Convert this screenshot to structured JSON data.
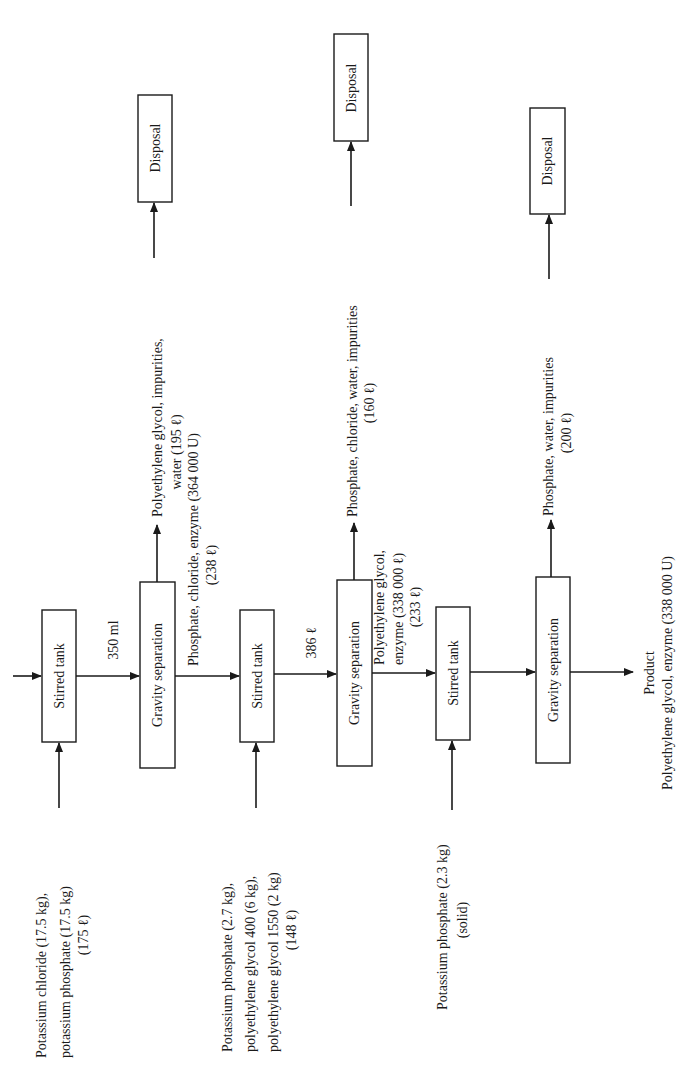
{
  "diagram": {
    "orientation": "rotated 90° counter-clockwise (text reads bottom-to-top)",
    "units": {
      "box": [
        {
          "id": "stirred-tank-1",
          "label": "Stirred tank"
        },
        {
          "id": "gravity-separation-1",
          "label": "Gravity separation"
        },
        {
          "id": "stirred-tank-2",
          "label": "Stirred tank"
        },
        {
          "id": "gravity-separation-2",
          "label": "Gravity separation"
        },
        {
          "id": "stirred-tank-3",
          "label": "Stirred tank"
        },
        {
          "id": "gravity-separation-3",
          "label": "Gravity separation"
        },
        {
          "id": "disposal-1",
          "label": "Disposal"
        },
        {
          "id": "disposal-2",
          "label": "Disposal"
        },
        {
          "id": "disposal-3",
          "label": "Disposal"
        }
      ]
    },
    "feeds": [
      {
        "lines": [
          "Potassium chloride (17.5 kg),",
          "potassium phosphate (17.5 kg)",
          "(175 ℓ)"
        ]
      },
      {
        "lines": [
          "Potassium phosphate (2.7 kg),",
          "polyethylene glycol 400 (6 kg),",
          "polyethylene glycol 1550 (2 kg)",
          "(148 ℓ)"
        ]
      },
      {
        "lines": [
          "Potassium phosphate (2.3 kg)",
          "(solid)"
        ]
      }
    ],
    "streams": [
      {
        "lines": [
          "350 ml"
        ]
      },
      {
        "lines": [
          "Phosphate, chloride, enzyme (364 000 U)",
          "(238 ℓ)"
        ]
      },
      {
        "lines": [
          "386 ℓ"
        ]
      },
      {
        "lines": [
          "Polyethylene glycol,",
          "enzyme (338 000 ℓ)",
          "(233 ℓ)"
        ]
      }
    ],
    "wastes": [
      {
        "lines": [
          "Polyethylene glycol, impurities,",
          "water (195 ℓ)"
        ]
      },
      {
        "lines": [
          "Phosphate, chloride, water, impurities",
          "(160 ℓ)"
        ]
      },
      {
        "lines": [
          "Phosphate, water, impurities",
          "(200 ℓ)"
        ]
      }
    ],
    "product": {
      "lines": [
        "Product",
        "Polyethylene glycol, enzyme (338 000 U)"
      ]
    }
  }
}
